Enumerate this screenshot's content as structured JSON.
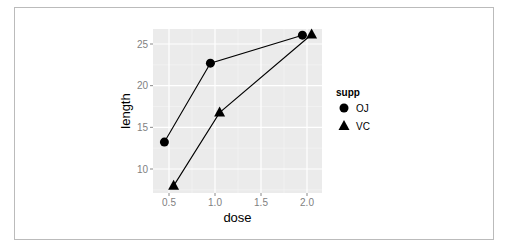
{
  "chart_data": {
    "type": "line",
    "title": "",
    "xlabel": "dose",
    "ylabel": "length",
    "x_ticks": [
      "0.5",
      "1.0",
      "1.5",
      "2.0"
    ],
    "y_ticks": [
      "10",
      "15",
      "20",
      "25"
    ],
    "xlim": [
      0.4,
      2.1
    ],
    "ylim": [
      7.3,
      26.6
    ],
    "grid": true,
    "legend": {
      "title": "supp",
      "position": "right",
      "entries": [
        {
          "label": "OJ",
          "shape": "circle"
        },
        {
          "label": "VC",
          "shape": "triangle"
        }
      ]
    },
    "series": [
      {
        "name": "OJ",
        "x": [
          0.45,
          0.95,
          1.95
        ],
        "y": [
          13.23,
          22.7,
          26.06
        ]
      },
      {
        "name": "VC",
        "x": [
          0.55,
          1.05,
          2.05
        ],
        "y": [
          7.98,
          16.77,
          26.14
        ]
      }
    ]
  }
}
